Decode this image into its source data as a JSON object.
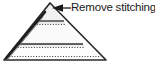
{
  "figure": {
    "kind": "sewing-instruction-diagram",
    "callout": {
      "label": "Remove stitching.",
      "leader_line": "horizontal leader with left arrowhead",
      "arrow_target": "cone apex seam"
    },
    "colors": {
      "outline": "#2b2b2b",
      "seam_highlight": "#1e1e1e",
      "fill_light": "#f4f4f4",
      "fill_band": "#ebebeb",
      "fill_base": "#fbfbfb",
      "dotted_stitch": "#4d4d4d",
      "text": "#1a1a1a",
      "page_background": "#ffffff"
    },
    "geometry": {
      "apex": [
        50,
        3
      ],
      "bottom_left": [
        4,
        60
      ],
      "bottom_right": [
        106,
        60
      ],
      "stitch_rows": [
        {
          "name": "upper-stitch-row",
          "y": 21
        },
        {
          "name": "lower-stitch-row",
          "y": 44
        },
        {
          "name": "hem-stitch-row",
          "y": 57
        }
      ],
      "seam_line": {
        "from": [
          44,
          13
        ],
        "to": [
          7,
          57
        ]
      }
    },
    "parts": [
      {
        "name": "cone-outline",
        "label": "cone outline"
      },
      {
        "name": "apex-panel",
        "label": "apex panel"
      },
      {
        "name": "middle-band",
        "label": "middle band"
      },
      {
        "name": "base-band",
        "label": "base band"
      },
      {
        "name": "seam-stitching",
        "label": "seam stitching"
      }
    ]
  }
}
